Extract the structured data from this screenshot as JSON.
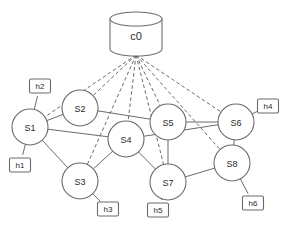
{
  "diagram": {
    "background_color": "#ffffff",
    "stroke_color": "#6b6b6b",
    "text_color": "#2b2b2b"
  },
  "controller": {
    "id": "c0",
    "label": "c0",
    "shape": "cylinder-icon",
    "x": 136,
    "y": 34,
    "rx": 26,
    "ry": 7,
    "body_height": 30,
    "anchor_x": 136,
    "anchor_y": 55
  },
  "switches": [
    {
      "id": "s1",
      "label": "S1",
      "x": 30,
      "y": 127,
      "r": 18
    },
    {
      "id": "s2",
      "label": "S2",
      "x": 80,
      "y": 108,
      "r": 18
    },
    {
      "id": "s3",
      "label": "S3",
      "x": 80,
      "y": 181,
      "r": 18
    },
    {
      "id": "s4",
      "label": "S4",
      "x": 126,
      "y": 139,
      "r": 18
    },
    {
      "id": "s5",
      "label": "S5",
      "x": 168,
      "y": 122,
      "r": 18
    },
    {
      "id": "s6",
      "label": "S6",
      "x": 236,
      "y": 122,
      "r": 18
    },
    {
      "id": "s7",
      "label": "S7",
      "x": 168,
      "y": 182,
      "r": 18
    },
    {
      "id": "s8",
      "label": "S8",
      "x": 232,
      "y": 163,
      "r": 18
    }
  ],
  "hosts": [
    {
      "id": "h1",
      "label": "h1",
      "x": 20,
      "y": 165,
      "w": 21,
      "h": 14
    },
    {
      "id": "h2",
      "label": "h2",
      "x": 40,
      "y": 86,
      "w": 21,
      "h": 14
    },
    {
      "id": "h3",
      "label": "h3",
      "x": 108,
      "y": 209,
      "w": 21,
      "h": 14
    },
    {
      "id": "h4",
      "label": "h4",
      "x": 268,
      "y": 106,
      "w": 21,
      "h": 14
    },
    {
      "id": "h5",
      "label": "h5",
      "x": 158,
      "y": 210,
      "w": 21,
      "h": 14
    },
    {
      "id": "h6",
      "label": "h6",
      "x": 253,
      "y": 203,
      "w": 21,
      "h": 14
    }
  ],
  "control_links": [
    {
      "from": "c0",
      "to": "s1",
      "style": "dashed"
    },
    {
      "from": "c0",
      "to": "s2",
      "style": "dashed"
    },
    {
      "from": "c0",
      "to": "s3",
      "style": "dashed"
    },
    {
      "from": "c0",
      "to": "s4",
      "style": "dashed"
    },
    {
      "from": "c0",
      "to": "s5",
      "style": "dashed"
    },
    {
      "from": "c0",
      "to": "s6",
      "style": "dashed"
    },
    {
      "from": "c0",
      "to": "s7",
      "style": "dashed"
    },
    {
      "from": "c0",
      "to": "s8",
      "style": "dashed"
    }
  ],
  "data_links": [
    {
      "from": "s1",
      "to": "s2",
      "style": "solid"
    },
    {
      "from": "s1",
      "to": "s3",
      "style": "solid"
    },
    {
      "from": "s1",
      "to": "s4",
      "style": "solid"
    },
    {
      "from": "s2",
      "to": "s5",
      "style": "solid"
    },
    {
      "from": "s3",
      "to": "s4",
      "style": "solid"
    },
    {
      "from": "s4",
      "to": "s6",
      "style": "solid"
    },
    {
      "from": "s4",
      "to": "s7",
      "style": "solid"
    },
    {
      "from": "s5",
      "to": "s6",
      "style": "solid"
    },
    {
      "from": "s5",
      "to": "s7",
      "style": "solid"
    },
    {
      "from": "s6",
      "to": "s8",
      "style": "solid"
    },
    {
      "from": "s7",
      "to": "s8",
      "style": "solid"
    }
  ],
  "host_links": [
    {
      "from": "h1",
      "to": "s1",
      "style": "solid"
    },
    {
      "from": "h2",
      "to": "s1",
      "style": "solid"
    },
    {
      "from": "h3",
      "to": "s3",
      "style": "solid"
    },
    {
      "from": "h4",
      "to": "s6",
      "style": "solid"
    },
    {
      "from": "h5",
      "to": "s7",
      "style": "solid"
    },
    {
      "from": "h6",
      "to": "s8",
      "style": "solid"
    }
  ]
}
